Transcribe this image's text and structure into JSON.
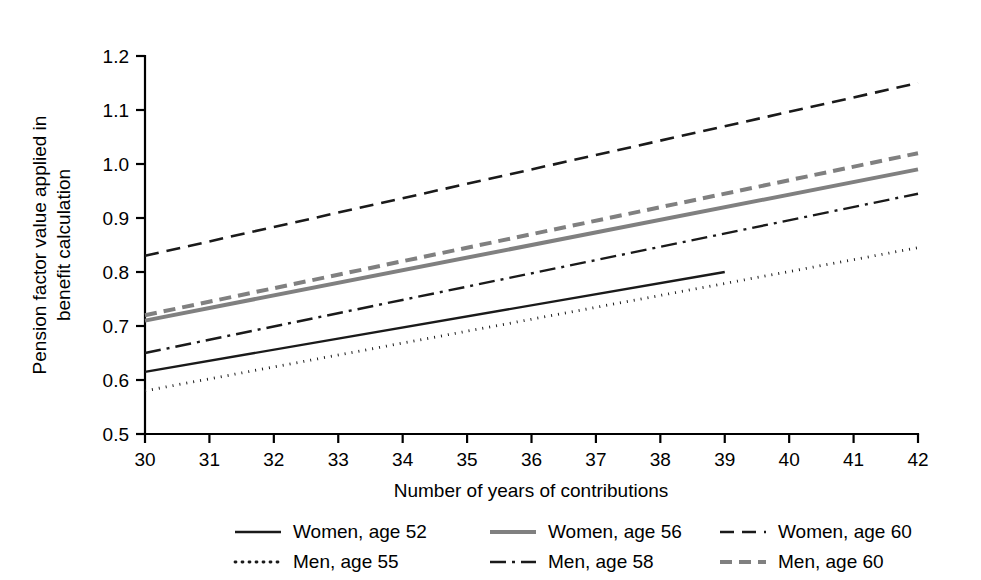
{
  "chart_data": {
    "type": "line",
    "title": "",
    "xlabel": "Number of years of contributions",
    "ylabel": "Pension factor value applied in benefit calculation",
    "ylabel_line1": "Pension factor value applied in",
    "ylabel_line2": "benefit calculation",
    "xlim": [
      30,
      42
    ],
    "ylim": [
      0.5,
      1.2
    ],
    "grid": false,
    "legend_position": "bottom",
    "x_ticks": [
      30,
      31,
      32,
      33,
      34,
      35,
      36,
      37,
      38,
      39,
      40,
      41,
      42
    ],
    "x_tick_labels": [
      "30",
      "31",
      "32",
      "33",
      "34",
      "35",
      "36",
      "37",
      "38",
      "39",
      "40",
      "41",
      "42"
    ],
    "y_ticks": [
      0.5,
      0.6,
      0.7,
      0.8,
      0.9,
      1.0,
      1.1,
      1.2
    ],
    "y_tick_labels": [
      "0.5",
      "0.6",
      "0.7",
      "0.8",
      "0.9",
      "1.0",
      "1.1",
      "1.2"
    ],
    "series": [
      {
        "name": "Women, age 52",
        "style": "solid",
        "color": "#1a1a1a",
        "width": 2.4,
        "dash": "",
        "x": [
          30,
          39
        ],
        "values": [
          0.615,
          0.8
        ]
      },
      {
        "name": "Women, age 56",
        "style": "solid",
        "color": "#808080",
        "width": 4.0,
        "dash": "",
        "x": [
          30,
          42
        ],
        "values": [
          0.71,
          0.99
        ]
      },
      {
        "name": "Women, age 60",
        "style": "dashed",
        "color": "#1a1a1a",
        "width": 2.6,
        "dash": "14,8",
        "x": [
          30,
          42
        ],
        "values": [
          0.83,
          1.15
        ]
      },
      {
        "name": "Men, age 55",
        "style": "dotted",
        "color": "#1a1a1a",
        "width": 2.8,
        "dash": "1,6",
        "x": [
          30,
          42
        ],
        "values": [
          0.58,
          0.845
        ]
      },
      {
        "name": "Men, age 58",
        "style": "dashdot",
        "color": "#1a1a1a",
        "width": 2.4,
        "dash": "16,6,3,6",
        "x": [
          30,
          42
        ],
        "values": [
          0.65,
          0.945
        ]
      },
      {
        "name": "Men, age 60",
        "style": "dashed",
        "color": "#808080",
        "width": 4.0,
        "dash": "12,7",
        "x": [
          30,
          42
        ],
        "values": [
          0.72,
          1.02
        ]
      }
    ],
    "legend_rows": [
      [
        "Women, age 52",
        "Women, age 56",
        "Women, age 60"
      ],
      [
        "Men, age 55",
        "Men, age 58",
        "Men, age 60"
      ]
    ]
  },
  "colors": {
    "black": "#1a1a1a",
    "gray": "#808080",
    "background": "#ffffff"
  }
}
